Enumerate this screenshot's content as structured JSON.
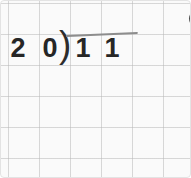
{
  "page": {
    "background_color": "#fafafa",
    "grid_color": "#b9b9b9",
    "ink_color": "#262626",
    "vinculum_color": "#8d8d8d"
  },
  "problem": {
    "notation": "long-division",
    "divisor": "20",
    "dividend": "11",
    "divisor_digits": [
      "2",
      "0"
    ],
    "dividend_digits": [
      "1",
      "1"
    ],
    "bracket_glyph": ")"
  }
}
